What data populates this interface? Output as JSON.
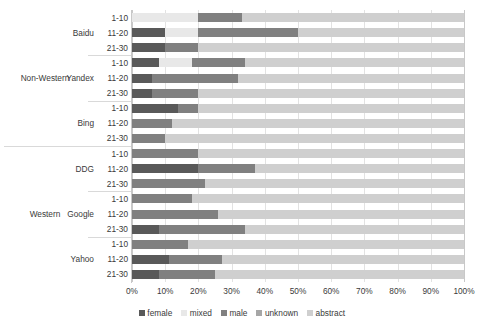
{
  "chart_data": {
    "type": "bar",
    "orientation": "horizontal",
    "stacked": true,
    "normalized": true,
    "title": "",
    "xlabel": "",
    "ylabel": "",
    "xlim": [
      0,
      100
    ],
    "grid": true,
    "legend_position": "bottom",
    "x_tick_labels": [
      "0%",
      "10%",
      "20%",
      "30%",
      "40%",
      "50%",
      "60%",
      "70%",
      "80%",
      "90%",
      "100%"
    ],
    "x_tick_values": [
      0,
      10,
      20,
      30,
      40,
      50,
      60,
      70,
      80,
      90,
      100
    ],
    "series": [
      {
        "name": "female",
        "color": "#595959"
      },
      {
        "name": "mixed",
        "color": "#e8e8e8"
      },
      {
        "name": "male",
        "color": "#808080"
      },
      {
        "name": "unknown",
        "color": "#a6a6a6"
      },
      {
        "name": "abstract",
        "color": "#cfcfcf"
      }
    ],
    "outer_groups": [
      {
        "label": "Non-Western",
        "engines": [
          "Baidu",
          "Yandex",
          "Bing"
        ]
      },
      {
        "label": "Western",
        "engines": [
          "DDG",
          "Google",
          "Yahoo"
        ]
      }
    ],
    "rank_bands": [
      "1-10",
      "11-20",
      "21-30"
    ],
    "rows": [
      {
        "group": "Non-Western",
        "engine": "Baidu",
        "rank": "1-10",
        "values": {
          "female": 0,
          "mixed": 20,
          "male": 13,
          "unknown": 0,
          "abstract": 67
        }
      },
      {
        "group": "Non-Western",
        "engine": "Baidu",
        "rank": "11-20",
        "values": {
          "female": 10,
          "mixed": 10,
          "male": 30,
          "unknown": 0,
          "abstract": 50
        }
      },
      {
        "group": "Non-Western",
        "engine": "Baidu",
        "rank": "21-30",
        "values": {
          "female": 10,
          "mixed": 0,
          "male": 10,
          "unknown": 0,
          "abstract": 80
        }
      },
      {
        "group": "Non-Western",
        "engine": "Yandex",
        "rank": "1-10",
        "values": {
          "female": 8,
          "mixed": 10,
          "male": 16,
          "unknown": 0,
          "abstract": 66
        }
      },
      {
        "group": "Non-Western",
        "engine": "Yandex",
        "rank": "11-20",
        "values": {
          "female": 6,
          "mixed": 0,
          "male": 26,
          "unknown": 0,
          "abstract": 68
        }
      },
      {
        "group": "Non-Western",
        "engine": "Yandex",
        "rank": "21-30",
        "values": {
          "female": 6,
          "mixed": 0,
          "male": 14,
          "unknown": 0,
          "abstract": 80
        }
      },
      {
        "group": "Non-Western",
        "engine": "Bing",
        "rank": "1-10",
        "values": {
          "female": 14,
          "mixed": 0,
          "male": 6,
          "unknown": 0,
          "abstract": 80
        }
      },
      {
        "group": "Non-Western",
        "engine": "Bing",
        "rank": "11-20",
        "values": {
          "female": 0,
          "mixed": 0,
          "male": 12,
          "unknown": 0,
          "abstract": 88
        }
      },
      {
        "group": "Non-Western",
        "engine": "Bing",
        "rank": "21-30",
        "values": {
          "female": 0,
          "mixed": 0,
          "male": 10,
          "unknown": 0,
          "abstract": 90
        }
      },
      {
        "group": "Western",
        "engine": "DDG",
        "rank": "1-10",
        "values": {
          "female": 0,
          "mixed": 0,
          "male": 20,
          "unknown": 0,
          "abstract": 80
        }
      },
      {
        "group": "Western",
        "engine": "DDG",
        "rank": "11-20",
        "values": {
          "female": 20,
          "mixed": 0,
          "male": 17,
          "unknown": 0,
          "abstract": 63
        }
      },
      {
        "group": "Western",
        "engine": "DDG",
        "rank": "21-30",
        "values": {
          "female": 0,
          "mixed": 0,
          "male": 22,
          "unknown": 0,
          "abstract": 78
        }
      },
      {
        "group": "Western",
        "engine": "Google",
        "rank": "1-10",
        "values": {
          "female": 0,
          "mixed": 0,
          "male": 18,
          "unknown": 0,
          "abstract": 82
        }
      },
      {
        "group": "Western",
        "engine": "Google",
        "rank": "11-20",
        "values": {
          "female": 0,
          "mixed": 0,
          "male": 26,
          "unknown": 0,
          "abstract": 74
        }
      },
      {
        "group": "Western",
        "engine": "Google",
        "rank": "21-30",
        "values": {
          "female": 8,
          "mixed": 0,
          "male": 26,
          "unknown": 0,
          "abstract": 66
        }
      },
      {
        "group": "Western",
        "engine": "Yahoo",
        "rank": "1-10",
        "values": {
          "female": 0,
          "mixed": 0,
          "male": 17,
          "unknown": 0,
          "abstract": 83
        }
      },
      {
        "group": "Western",
        "engine": "Yahoo",
        "rank": "11-20",
        "values": {
          "female": 11,
          "mixed": 0,
          "male": 16,
          "unknown": 0,
          "abstract": 73
        }
      },
      {
        "group": "Western",
        "engine": "Yahoo",
        "rank": "21-30",
        "values": {
          "female": 8,
          "mixed": 0,
          "male": 17,
          "unknown": 0,
          "abstract": 75
        }
      }
    ]
  }
}
